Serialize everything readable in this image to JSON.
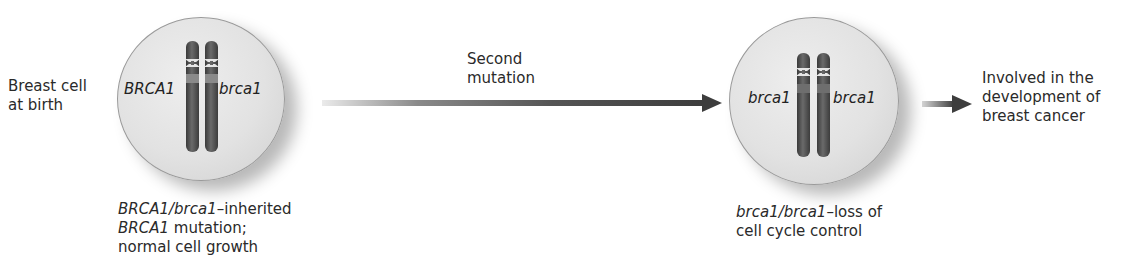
{
  "diagram": {
    "start_label": [
      "Breast cell",
      "at birth"
    ],
    "cell1": {
      "gene_left": "BRCA1",
      "gene_right": "brca1",
      "caption_line1_italic": "BRCA1/brca1",
      "caption_line1_rest": "–inherited",
      "caption_line2_italic": "BRCA1",
      "caption_line2_rest": " mutation;",
      "caption_line3": "normal cell growth"
    },
    "transition_label": [
      "Second",
      "mutation"
    ],
    "cell2": {
      "gene_left": "brca1",
      "gene_right": "brca1",
      "caption_line1_italic": "brca1/brca1",
      "caption_line1_rest": "–loss of",
      "caption_line2": "cell cycle control"
    },
    "outcome_label": [
      "Involved in the",
      "development of",
      "breast cancer"
    ],
    "colors": {
      "arrow": "#3d3d3d",
      "chromosome": "#4a4a4a",
      "cell_fill": "#e4e4e4",
      "cell_border": "#9a9a9a"
    }
  }
}
